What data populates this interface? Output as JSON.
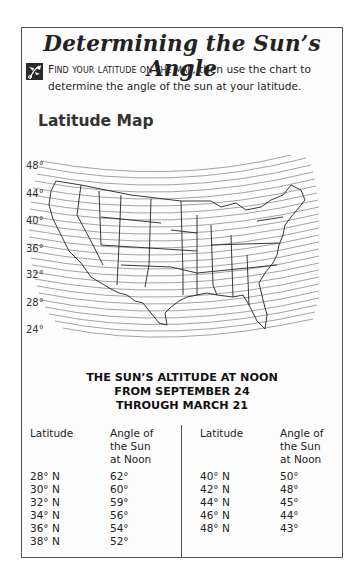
{
  "title": "Determining the Sun’s Angle",
  "instructions": {
    "icon": "leaf-ornament-icon",
    "smallcaps_lead": "Find your latitude on the map,",
    "line1_rest": " then use the chart to",
    "line2": "determine the angle of the sun at your latitude."
  },
  "map": {
    "title": "Latitude Map",
    "latitude_labels": [
      "48°",
      "44°",
      "40°",
      "36°",
      "32°",
      "28°",
      "24°"
    ]
  },
  "table": {
    "title_lines": [
      "THE SUN’S ALTITUDE AT NOON",
      "FROM SEPTEMBER 24",
      "THROUGH MARCH 21"
    ],
    "headers": {
      "latitude": "Latitude",
      "angle_l1": "Angle of",
      "angle_l2": "the Sun",
      "angle_l3": "at Noon"
    },
    "left_rows": [
      {
        "latitude": "28° N",
        "angle": "62°"
      },
      {
        "latitude": "30° N",
        "angle": "60°"
      },
      {
        "latitude": "32° N",
        "angle": "59°"
      },
      {
        "latitude": "34° N",
        "angle": "56°"
      },
      {
        "latitude": "36° N",
        "angle": "54°"
      },
      {
        "latitude": "38° N",
        "angle": "52°"
      }
    ],
    "right_rows": [
      {
        "latitude": "40° N",
        "angle": "50°"
      },
      {
        "latitude": "42° N",
        "angle": "48°"
      },
      {
        "latitude": "44° N",
        "angle": "45°"
      },
      {
        "latitude": "46° N",
        "angle": "44°"
      },
      {
        "latitude": "48° N",
        "angle": "43°"
      }
    ]
  }
}
